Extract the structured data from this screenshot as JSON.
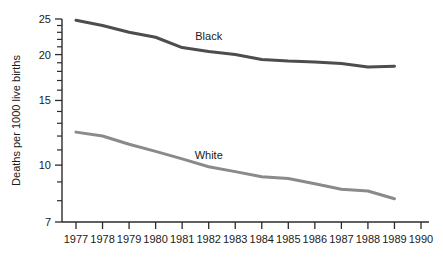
{
  "chart_data": {
    "type": "line",
    "title": "",
    "xlabel": "",
    "ylabel": "Deaths per 1000 live births",
    "yscale": "log",
    "ylim": [
      7,
      25
    ],
    "xlim": [
      1977,
      1990
    ],
    "grid": false,
    "legend_position": "inline-annotation",
    "x": [
      1977,
      1978,
      1979,
      1980,
      1981,
      1982,
      1983,
      1984,
      1985,
      1986,
      1987,
      1988,
      1989
    ],
    "y_major_ticks": [
      25,
      20,
      15,
      10,
      7
    ],
    "y_tick_labels": [
      "25",
      "20",
      "15",
      "10",
      "7"
    ],
    "y_minor_ticks": [
      24,
      23,
      22,
      21,
      19,
      18,
      17,
      16,
      14,
      13,
      12,
      11,
      9,
      8
    ],
    "x_tick_labels": [
      "1977",
      "1978",
      "1979",
      "1980",
      "1981",
      "1982",
      "1983",
      "1984",
      "1985",
      "1986",
      "1987",
      "1988",
      "1989",
      "1990"
    ],
    "x_ticks": [
      1977,
      1978,
      1979,
      1980,
      1981,
      1982,
      1983,
      1984,
      1985,
      1986,
      1987,
      1988,
      1989,
      1990
    ],
    "series": [
      {
        "name": "Black",
        "color": "#4d4d4d",
        "line_width": 3.0,
        "label_x": 1982.0,
        "label_y": 21.9,
        "values": [
          24.8,
          24.0,
          23.0,
          22.3,
          20.9,
          20.4,
          20.0,
          19.4,
          19.2,
          19.1,
          18.9,
          18.5,
          18.6
        ]
      },
      {
        "name": "White",
        "color": "#8a8a8a",
        "line_width": 3.0,
        "label_x": 1982.0,
        "label_y": 10.4,
        "values": [
          12.3,
          12.0,
          11.4,
          10.9,
          10.4,
          9.9,
          9.6,
          9.3,
          9.2,
          8.9,
          8.6,
          8.5,
          8.1
        ]
      }
    ]
  }
}
